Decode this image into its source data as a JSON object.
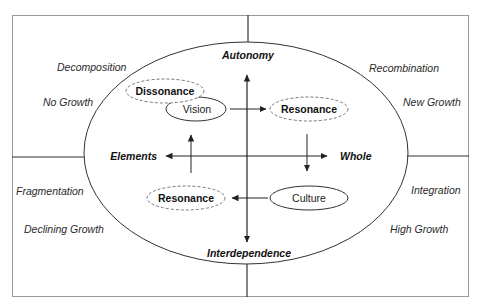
{
  "diagram": {
    "type": "quadrant-ellipse-concept-map",
    "axes": {
      "top": "Autonomy",
      "bottom": "Interdependence",
      "left": "Elements",
      "right": "Whole"
    },
    "quadrant_labels": {
      "top_left": {
        "phase": "Decomposition",
        "growth": "No Growth"
      },
      "top_right": {
        "phase": "Recombination",
        "growth": "New Growth"
      },
      "bottom_left": {
        "phase": "Fragmentation",
        "growth": "Declining Growth"
      },
      "bottom_right": {
        "phase": "Integration",
        "growth": "High Growth"
      }
    },
    "nodes": [
      {
        "id": "dissonance",
        "label": "Dissonance",
        "style": "dashed-bold",
        "quadrant": "top_left"
      },
      {
        "id": "vision",
        "label": "Vision",
        "style": "solid",
        "quadrant": "top_left"
      },
      {
        "id": "resonance_top",
        "label": "Resonance",
        "style": "dashed-bold",
        "quadrant": "top_right"
      },
      {
        "id": "culture",
        "label": "Culture",
        "style": "solid",
        "quadrant": "bottom_right"
      },
      {
        "id": "resonance_bottom",
        "label": "Resonance",
        "style": "dashed-bold",
        "quadrant": "bottom_left"
      }
    ],
    "edges": [
      {
        "from": "vision",
        "to": "resonance_top"
      },
      {
        "from": "resonance_top",
        "to": "culture",
        "direction": "down"
      },
      {
        "from": "culture",
        "to": "resonance_bottom"
      },
      {
        "from": "resonance_bottom",
        "to": "vision",
        "direction": "up"
      }
    ],
    "colors": {
      "line": "#333333",
      "frame": "#9a9a9a",
      "dashed": "#777777"
    }
  }
}
